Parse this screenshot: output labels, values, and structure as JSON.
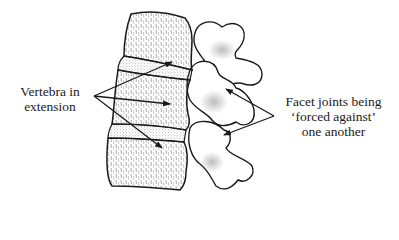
{
  "diagram": {
    "colors": {
      "ink": "#1a1a1a",
      "background": "#ffffff",
      "stipple": "#8a8a8a"
    },
    "labels": {
      "vertebra": {
        "lines": [
          "Vertebra in",
          "extension"
        ],
        "arrow_count": 3
      },
      "facet": {
        "lines": [
          "Facet joints being",
          "‘forced against’",
          "one another"
        ],
        "arrow_count": 2
      }
    },
    "structures": [
      {
        "name": "upper-vertebral-body"
      },
      {
        "name": "upper-disc"
      },
      {
        "name": "middle-vertebral-body"
      },
      {
        "name": "lower-disc"
      },
      {
        "name": "lower-vertebral-body"
      },
      {
        "name": "upper-facet-process"
      },
      {
        "name": "middle-facet-process"
      },
      {
        "name": "lower-facet-process"
      }
    ]
  }
}
